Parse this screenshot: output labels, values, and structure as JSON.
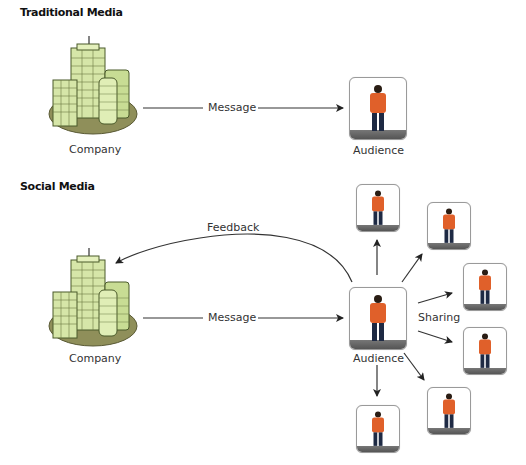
{
  "traditional": {
    "title": "Traditional Media",
    "company_label": "Company",
    "message_label": "Message",
    "audience_label": "Audience"
  },
  "social": {
    "title": "Social Media",
    "company_label": "Company",
    "message_label": "Message",
    "feedback_label": "Feedback",
    "audience_label": "Audience",
    "sharing_label": "Sharing",
    "shared_audience_count": 6
  },
  "icons": {
    "company": "office-buildings-icon",
    "audience": "person-icon"
  },
  "colors": {
    "building_fill": "#d6e6a8",
    "building_stroke": "#4a5a2a",
    "base_ellipse": "#8f8f5a",
    "shirt": "#e0602a",
    "pants": "#1e2a44",
    "arrow": "#222222"
  }
}
